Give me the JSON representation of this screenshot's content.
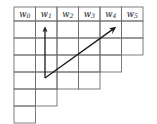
{
  "figure": {
    "width": 157,
    "height": 124,
    "background": "#ffffff",
    "grid_line_color": "#6f6f6f",
    "grid_line_width": 0.9,
    "arrow_color": "#1a1a1a",
    "arrow_line_width": 1.3,
    "label_color": "#1a1a1a"
  },
  "geometry": {
    "origin_x": 14,
    "origin_y": 7,
    "cell_width": 21.5,
    "header_height": 14,
    "row_height": 17,
    "num_columns": 6,
    "column_body_rows": [
      6,
      5,
      4,
      4,
      3,
      2
    ]
  },
  "columns": [
    {
      "base": "w",
      "sub": "0",
      "label": "w0",
      "body_rows": 6
    },
    {
      "base": "w",
      "sub": "1",
      "label": "w1",
      "body_rows": 5
    },
    {
      "base": "w",
      "sub": "2",
      "label": "w2",
      "body_rows": 4
    },
    {
      "base": "w",
      "sub": "3",
      "label": "w3",
      "body_rows": 4
    },
    {
      "base": "w",
      "sub": "4",
      "label": "w4",
      "body_rows": 3
    },
    {
      "base": "w",
      "sub": "5",
      "label": "w5",
      "body_rows": 2
    }
  ],
  "arrows": [
    {
      "name": "vertical-arrow",
      "from_x": 45.0,
      "from_y": 78.0,
      "to_x": 45.0,
      "to_y": 27.0,
      "direction": "up",
      "head_size": 5.0
    },
    {
      "name": "diagonal-arrow",
      "from_x": 45.0,
      "from_y": 78.0,
      "to_x": 116.0,
      "to_y": 27.0,
      "direction": "up-right",
      "head_size": 5.0
    }
  ]
}
